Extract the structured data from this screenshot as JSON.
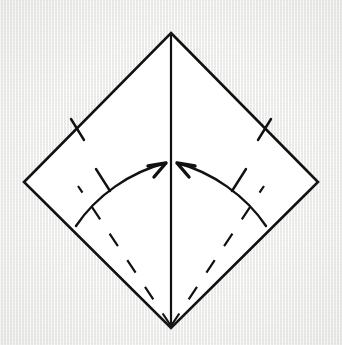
{
  "figure": {
    "step_type": "valley-fold-to-center",
    "canvas": {
      "width": 342,
      "height": 345
    },
    "background_color": "#f4f4f2",
    "ink_color": "#111111"
  },
  "paper": {
    "name": "square-sheet-diamond",
    "fill_color": "#ffffff",
    "stroke_color": "#111111",
    "stroke_width": 2.6,
    "vertices": {
      "top": {
        "x": 171,
        "y": 33
      },
      "right": {
        "x": 318,
        "y": 182
      },
      "bottom": {
        "x": 171,
        "y": 328
      },
      "left": {
        "x": 24,
        "y": 182
      }
    },
    "points_attr": "171,33 318,182 171,328 24,182"
  },
  "creases": {
    "center_line": {
      "name": "vertical-center-crease",
      "style": "solid",
      "x1": 171,
      "y1": 35,
      "x2": 171,
      "y2": 327,
      "stroke_width": 2.2
    },
    "fold_lines": [
      {
        "name": "left-fold-crease",
        "style": "dashed",
        "x1": 171,
        "y1": 326,
        "x2": 78,
        "y2": 186,
        "stroke_width": 2.2,
        "dash_pattern": "15 17"
      },
      {
        "name": "right-fold-crease",
        "style": "dashed",
        "x1": 171,
        "y1": 326,
        "x2": 264,
        "y2": 186,
        "stroke_width": 2.2,
        "dash_pattern": "15 17"
      }
    ]
  },
  "arrows": [
    {
      "name": "left-fold-arrow",
      "direction": "right",
      "meaning": "fold lower-left edge to center",
      "path": "M 76 226 C 96 196, 130 172, 166 163",
      "head_path": "M 166 163 L 148 166 M 166 163 L 154 177",
      "stroke_width": 2.4
    },
    {
      "name": "right-fold-arrow",
      "direction": "left",
      "meaning": "fold lower-right edge to center",
      "path": "M 266 226 C 246 196, 212 172, 177 163",
      "head_path": "M 177 163 L 195 166 M 177 163 L 189 177",
      "stroke_width": 2.4
    }
  ],
  "tick_marks": [
    {
      "name": "tick-upper-left-edge",
      "x1": 71,
      "y1": 119,
      "x2": 84,
      "y2": 140
    },
    {
      "name": "tick-upper-right-edge",
      "x1": 271,
      "y1": 119,
      "x2": 258,
      "y2": 140
    },
    {
      "name": "tick-left-arrow",
      "x1": 96,
      "y1": 169,
      "x2": 110,
      "y2": 191
    },
    {
      "name": "tick-right-arrow",
      "x1": 246,
      "y1": 169,
      "x2": 232,
      "y2": 191
    }
  ]
}
